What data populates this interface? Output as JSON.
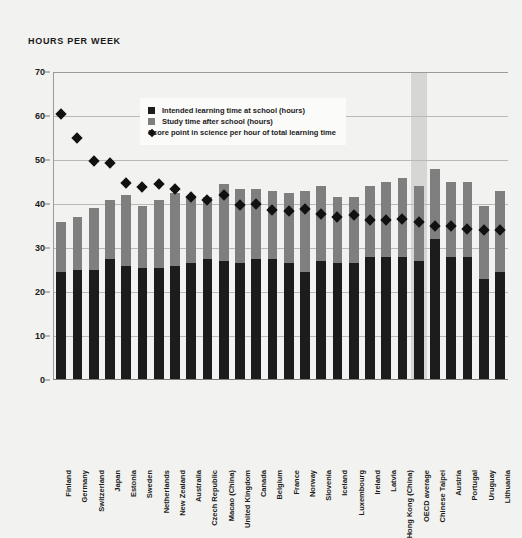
{
  "chart_title": "HOURS PER WEEK",
  "legend": {
    "position": "inside-top-left",
    "items": [
      {
        "marker": "square-dark-icon",
        "label": "Intended learning time at school (hours)",
        "color": "#1c1c1c"
      },
      {
        "marker": "square-gray-icon",
        "label": "Study time after school (hours)",
        "color": "#7f7f7f"
      },
      {
        "marker": "diamond-dark-icon",
        "label": "Score point in science per hour of total learning time",
        "color": "#111111"
      }
    ]
  },
  "colors": {
    "background": "#f2f2f0",
    "intended_learning": "#1c1c1c",
    "study_after_school": "#7f7f7f",
    "score_point_marker": "#111111",
    "highlight_band": "#d6d6d4",
    "gridline": "#b9b9b6"
  },
  "highlight": {
    "category": "OECD average"
  },
  "chart_data": {
    "type": "bar",
    "title": "HOURS PER WEEK",
    "xlabel": "",
    "ylabel": "HOURS PER WEEK",
    "ylim": [
      0,
      70
    ],
    "yticks": [
      0,
      10,
      20,
      30,
      40,
      50,
      60,
      70
    ],
    "grid": true,
    "stacked": true,
    "categories": [
      "Finland",
      "Germany",
      "Switzerland",
      "Japan",
      "Estonia",
      "Sweden",
      "Netherlands",
      "New Zealand",
      "Australia",
      "Czech Republic",
      "Macao (China)",
      "United Kingdom",
      "Canada",
      "Belgium",
      "France",
      "Norway",
      "Slovenia",
      "Iceland",
      "Luxembourg",
      "Ireland",
      "Latvia",
      "Hong Kong (China)",
      "OECD average",
      "Chinese Taipei",
      "Austria",
      "Portugal",
      "Uruguay",
      "Lithuania"
    ],
    "series": [
      {
        "name": "Intended learning time at school (hours)",
        "color": "#1c1c1c",
        "values": [
          24.5,
          25.0,
          25.0,
          27.5,
          26.0,
          25.5,
          25.5,
          26.0,
          26.5,
          27.5,
          27.0,
          26.5,
          27.5,
          27.5,
          26.5,
          24.5,
          27.0,
          26.5,
          26.5,
          28.0,
          28.0,
          28.0,
          27.0,
          32.0,
          28.0,
          28.0,
          23.0,
          24.5
        ]
      },
      {
        "name": "Study time after school (hours)",
        "color": "#7f7f7f",
        "values": [
          11.5,
          12.0,
          14.0,
          13.5,
          16.0,
          14.0,
          15.5,
          16.5,
          15.0,
          14.0,
          17.5,
          17.0,
          16.0,
          15.5,
          16.0,
          18.5,
          17.0,
          15.0,
          15.0,
          16.0,
          17.0,
          18.0,
          17.0,
          16.0,
          17.0,
          17.0,
          16.5,
          18.5
        ]
      },
      {
        "name": "Score point in science per hour of total learning time",
        "color": "#111111",
        "type": "scatter-diamond",
        "values": [
          60.5,
          55.0,
          49.7,
          49.4,
          44.7,
          43.8,
          44.5,
          43.3,
          41.6,
          40.8,
          42.0,
          39.8,
          40.0,
          38.7,
          38.5,
          38.8,
          37.7,
          37.0,
          37.4,
          36.3,
          36.3,
          36.5,
          35.9,
          35.1,
          34.9,
          34.4,
          34.2,
          34.1
        ]
      }
    ],
    "totals": [
      36.0,
      37.0,
      39.0,
      41.0,
      42.0,
      39.5,
      41.0,
      42.5,
      41.5,
      41.5,
      44.5,
      43.5,
      43.5,
      43.0,
      42.5,
      43.0,
      44.0,
      41.5,
      41.5,
      44.0,
      45.0,
      46.0,
      44.0,
      48.0,
      45.0,
      45.0,
      39.5,
      43.0
    ]
  }
}
